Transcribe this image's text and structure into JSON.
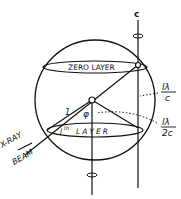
{
  "diagram": {
    "axis_label": "c",
    "zero_layer_label": "ZERO LAYER",
    "lth_layer_label": "LAYER",
    "lth_layer_prefix": "l",
    "lth_layer_sup": "th",
    "radius_label": "1",
    "angle_label": "φ",
    "beam_label_line1": "X-RAY",
    "beam_label_line2": "BEAM",
    "label_lc_num": "lλ",
    "label_lc_den": "c",
    "label_l2c_num": "lλ",
    "label_l2c_den": "2c"
  }
}
